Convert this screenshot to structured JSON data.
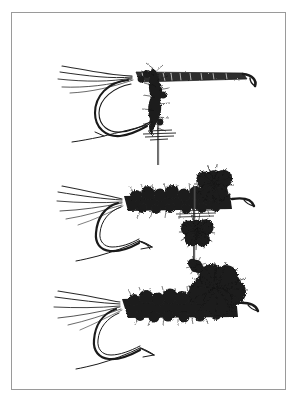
{
  "image": {
    "kind": "line-art-illustration",
    "subject": "fishing fly tying patterns",
    "width": 298,
    "height": 405,
    "background_color": "#ffffff",
    "ink_color": "#1a1a1a",
    "frame": {
      "present": true,
      "color": "#9a9a9a",
      "left": 11,
      "top": 12,
      "width": 275,
      "height": 378,
      "line_width": 1
    },
    "caption": "",
    "title": ""
  },
  "figures": [
    {
      "id": "fly-1",
      "name": "extended-body-parachute-mayfly",
      "position": {
        "x": 55,
        "y": 55,
        "width": 200,
        "height": 110
      },
      "parts": [
        {
          "name": "tail-fibers",
          "count": 5,
          "direction": "left",
          "length": 48
        },
        {
          "name": "extended-body",
          "style": "segmented-tapered-tube",
          "length": 120
        },
        {
          "name": "hook-eye",
          "style": "down-turned",
          "side": "right"
        },
        {
          "name": "hook-bend",
          "style": "curved-down-rear"
        },
        {
          "name": "hook-point",
          "style": "barbed-swept-left"
        },
        {
          "name": "parachute-post",
          "style": "vertical-needle",
          "length": 70
        },
        {
          "name": "hackle-collar",
          "style": "dubbed-fuzzy"
        }
      ]
    },
    {
      "id": "fly-2",
      "name": "dubbed-body-parachute-fly",
      "position": {
        "x": 55,
        "y": 170,
        "width": 200,
        "height": 105
      },
      "parts": [
        {
          "name": "tail-fibers",
          "count": 6,
          "direction": "left",
          "length": 46
        },
        {
          "name": "dubbed-body",
          "style": "shaggy-dubbing",
          "length": 110
        },
        {
          "name": "hook-eye",
          "style": "down-turned",
          "side": "right"
        },
        {
          "name": "hook-bend",
          "style": "curved-down-rear"
        },
        {
          "name": "hook-point",
          "style": "barbed-swept-right"
        },
        {
          "name": "wing-clump-upper",
          "style": "dense-hackle-ball"
        },
        {
          "name": "wing-clump-lower",
          "style": "dense-hackle-ball"
        },
        {
          "name": "parachute-post",
          "style": "vertical-needle",
          "length": 60
        }
      ]
    },
    {
      "id": "fly-3",
      "name": "dubbed-body-wing-clump-fly",
      "position": {
        "x": 55,
        "y": 270,
        "width": 200,
        "height": 105
      },
      "parts": [
        {
          "name": "tail-fibers",
          "count": 6,
          "direction": "left",
          "length": 50
        },
        {
          "name": "dubbed-body",
          "style": "shaggy-dubbing",
          "length": 115
        },
        {
          "name": "wing-clump",
          "style": "large-dense-hackle-ball"
        },
        {
          "name": "hook-eye",
          "style": "straight",
          "side": "right"
        },
        {
          "name": "hook-bend",
          "style": "curved-down-rear"
        },
        {
          "name": "hook-point",
          "style": "barbed-swept-right"
        }
      ]
    }
  ]
}
